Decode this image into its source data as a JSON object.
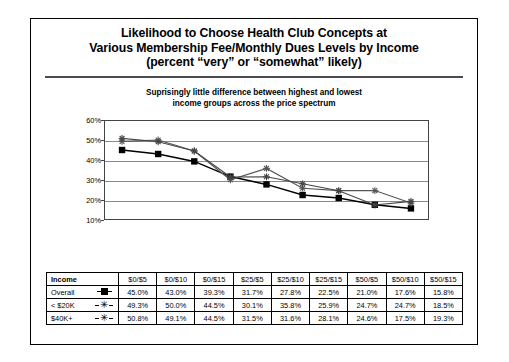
{
  "slide": {
    "title_lines": [
      "Likelihood to Choose Health Club Concepts at",
      "Various Membership Fee/Monthly Dues Levels by Income",
      "(percent “very” or “somewhat” likely)"
    ],
    "subtitle_lines": [
      "Suprisingly little difference between highest and lowest",
      "income groups across the price spectrum"
    ]
  },
  "chart_data": {
    "type": "line",
    "title": "Likelihood to Choose Health Club Concepts at Various Membership Fee/Monthly Dues Levels by Income (percent “very” or “somewhat” likely)",
    "subtitle": "Suprisingly little difference between highest and lowest income groups across the price spectrum",
    "xlabel": "",
    "ylabel": "",
    "categories": [
      "$0/$5",
      "$0/$10",
      "$0/$15",
      "$25/$5",
      "$25/$10",
      "$25/$15",
      "$50/$5",
      "$50/$10",
      "$50/$15"
    ],
    "ylim": [
      10,
      60
    ],
    "ytick_labels": [
      "60%",
      "50%",
      "40%",
      "30%",
      "20%",
      "10%"
    ],
    "ytick_values": [
      60,
      50,
      40,
      30,
      20,
      10
    ],
    "grid": true,
    "legend_position": "table",
    "series": [
      {
        "name": "Overall",
        "marker": "filled-square",
        "color": "#000000",
        "values": [
          45.0,
          43.0,
          39.3,
          31.7,
          27.8,
          22.5,
          21.0,
          17.6,
          15.8
        ],
        "labels": [
          "45.0%",
          "43.0%",
          "39.3%",
          "31.7%",
          "27.8%",
          "22.5%",
          "21.0%",
          "17.6%",
          "15.8%"
        ]
      },
      {
        "name": "< $20K",
        "marker": "star",
        "color": "#555555",
        "values": [
          49.3,
          50.0,
          44.5,
          30.1,
          35.8,
          25.9,
          24.7,
          24.7,
          18.5
        ],
        "labels": [
          "49.3%",
          "50.0%",
          "44.5%",
          "30.1%",
          "35.8%",
          "25.9%",
          "24.7%",
          "24.7%",
          "18.5%"
        ]
      },
      {
        "name": "$40K+",
        "marker": "star",
        "color": "#444444",
        "values": [
          50.8,
          49.1,
          44.5,
          31.5,
          31.6,
          28.1,
          24.6,
          17.5,
          19.3
        ],
        "labels": [
          "50.8%",
          "49.1%",
          "44.5%",
          "31.5%",
          "31.6%",
          "28.1%",
          "24.6%",
          "17.5%",
          "19.3%"
        ]
      }
    ]
  },
  "table": {
    "corner_header": "Income",
    "column_headers": [
      "$0/$5",
      "$0/$10",
      "$0/$15",
      "$25/$5",
      "$25/$10",
      "$25/$15",
      "$50/$5",
      "$50/$10",
      "$50/$15"
    ],
    "rows": [
      {
        "label": "Overall",
        "marker_glyph": "",
        "marker_kind": "filled-square",
        "values": [
          "45.0%",
          "43.0%",
          "39.3%",
          "31.7%",
          "27.8%",
          "22.5%",
          "21.0%",
          "17.6%",
          "15.8%"
        ]
      },
      {
        "label": "< $20K",
        "marker_glyph": "✳",
        "marker_kind": "star",
        "values": [
          "49.3%",
          "50.0%",
          "44.5%",
          "30.1%",
          "35.8%",
          "25.9%",
          "24.7%",
          "24.7%",
          "18.5%"
        ]
      },
      {
        "label": "$40K+",
        "marker_glyph": "✳",
        "marker_kind": "star",
        "values": [
          "50.8%",
          "49.1%",
          "44.5%",
          "31.5%",
          "31.6%",
          "28.1%",
          "24.6%",
          "17.5%",
          "19.3%"
        ]
      }
    ]
  }
}
